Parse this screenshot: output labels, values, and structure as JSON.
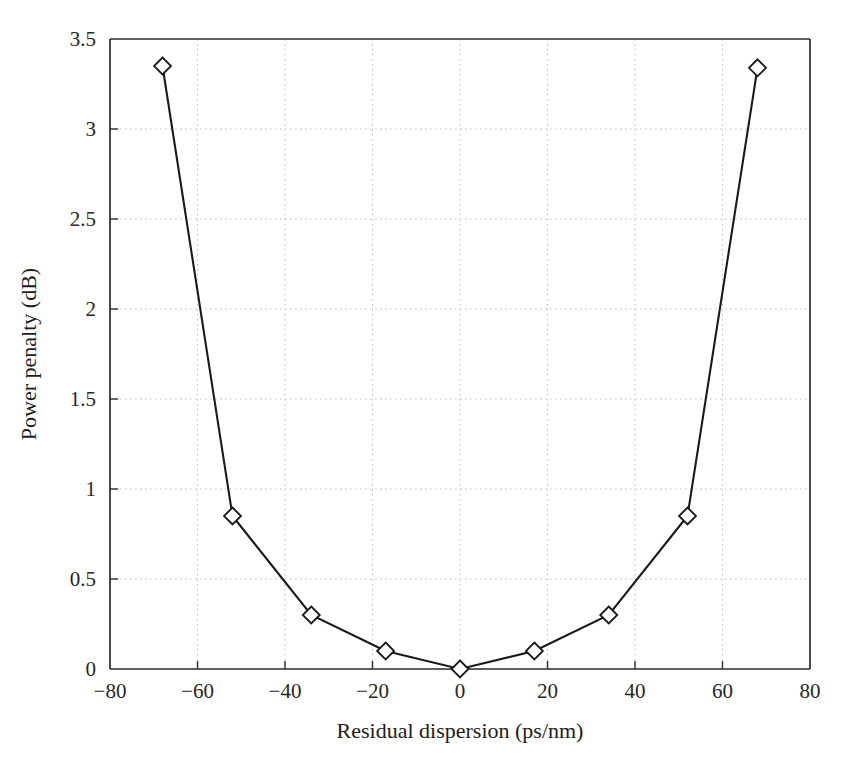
{
  "chart_data": {
    "type": "line",
    "title": "",
    "xlabel": "Residual dispersion (ps/nm)",
    "ylabel": "Power penalty (dB)",
    "xlim": [
      -80,
      80
    ],
    "ylim": [
      0,
      3.5
    ],
    "xticks": [
      -80,
      -60,
      -40,
      -20,
      0,
      20,
      40,
      60,
      80
    ],
    "xtick_labels": [
      "−80",
      "−60",
      "−40",
      "−20",
      "0",
      "20",
      "40",
      "60",
      "80"
    ],
    "yticks": [
      0,
      0.5,
      1,
      1.5,
      2,
      2.5,
      3,
      3.5
    ],
    "ytick_labels": [
      "0",
      "0.5",
      "1",
      "1.5",
      "2",
      "2.5",
      "3",
      "3.5"
    ],
    "grid": true,
    "grid_style": "dotted",
    "legend": null,
    "marker": "open-diamond",
    "line_color": "#1a1a1a",
    "marker_fill": "#ffffff",
    "marker_edge": "#1a1a1a",
    "x": [
      -68,
      -52,
      -34,
      -17,
      0,
      17,
      34,
      52,
      68
    ],
    "values": [
      3.35,
      0.85,
      0.3,
      0.1,
      0.0,
      0.1,
      0.3,
      0.85,
      3.34
    ],
    "series": [
      {
        "name": "Power penalty",
        "x": [
          -68,
          -52,
          -34,
          -17,
          0,
          17,
          34,
          52,
          68
        ],
        "values": [
          3.35,
          0.85,
          0.3,
          0.1,
          0.0,
          0.1,
          0.3,
          0.85,
          3.34
        ]
      }
    ]
  },
  "figure": {
    "background": "#ffffff",
    "frame_color": "#2b2b2b",
    "grid_color": "#bdbdbd"
  }
}
